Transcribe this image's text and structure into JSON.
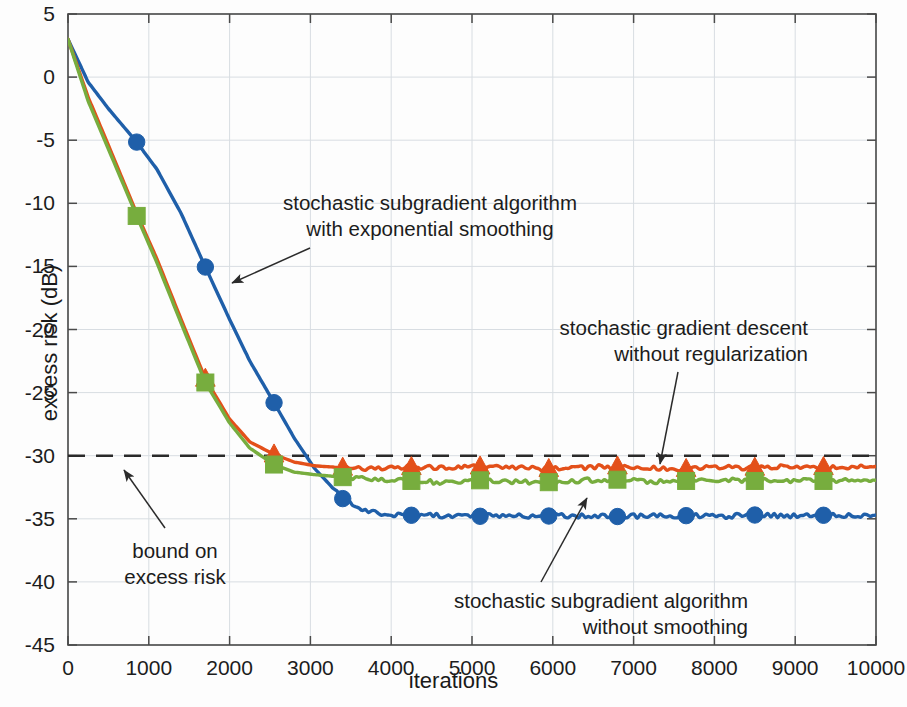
{
  "chart_data": {
    "type": "line",
    "title": "",
    "xlabel": "iterations",
    "ylabel": "excess risk (dB)",
    "xlim": [
      0,
      10000
    ],
    "ylim": [
      -45,
      5
    ],
    "xticks": [
      0,
      1000,
      2000,
      3000,
      4000,
      5000,
      6000,
      7000,
      8000,
      9000,
      10000
    ],
    "xtick_labels": [
      "0",
      "1000",
      "2000",
      "3000",
      "4000",
      "5000",
      "6000",
      "7000",
      "8000",
      "9000",
      "10000"
    ],
    "yticks": [
      5,
      0,
      -5,
      -10,
      -15,
      -20,
      -25,
      -30,
      -35,
      -40,
      -45
    ],
    "ytick_labels": [
      "5",
      "0",
      "-5",
      "-10",
      "-15",
      "-20",
      "-25",
      "-30",
      "-35",
      "-40",
      "-45"
    ],
    "grid": true,
    "legend_position": "none",
    "series": [
      {
        "name": "stochastic subgradient algorithm with exponential smoothing",
        "color": "#1f5fa9",
        "marker": "circle",
        "marker_every": 850,
        "x": [
          0,
          250,
          500,
          850,
          1100,
          1400,
          1700,
          2000,
          2250,
          2550,
          2800,
          3050,
          3400,
          3600,
          3800,
          4000,
          4250,
          4600,
          5100,
          5500,
          5950,
          6400,
          6800,
          7250,
          7650,
          8100,
          8500,
          8900,
          9350,
          9700,
          10000
        ],
        "y": [
          3.0,
          -0.4,
          -2.5,
          -5.15,
          -7.3,
          -10.8,
          -15.05,
          -19.2,
          -22.5,
          -25.8,
          -28.6,
          -31.0,
          -33.4,
          -34.2,
          -34.5,
          -34.65,
          -34.72,
          -34.75,
          -34.8,
          -34.75,
          -34.78,
          -34.75,
          -34.82,
          -34.78,
          -34.75,
          -34.8,
          -34.7,
          -34.75,
          -34.72,
          -34.7,
          -34.7
        ],
        "markers_x": [
          850,
          1700,
          2550,
          3400,
          4250,
          5100,
          5950,
          6800,
          7650,
          8500,
          9350
        ],
        "markers_y": [
          -5.15,
          -15.05,
          -25.8,
          -33.4,
          -34.72,
          -34.8,
          -34.78,
          -34.82,
          -34.75,
          -34.7,
          -34.72
        ]
      },
      {
        "name": "stochastic gradient descent without regularization",
        "color": "#e3501a",
        "marker": "triangle",
        "marker_every": 850,
        "x": [
          0,
          250,
          500,
          850,
          1100,
          1400,
          1700,
          2000,
          2250,
          2550,
          2800,
          3050,
          3400,
          3800,
          4250,
          4600,
          5100,
          5500,
          5950,
          6400,
          6800,
          7250,
          7650,
          8100,
          8500,
          8900,
          9350,
          9700,
          10000
        ],
        "y": [
          3.0,
          -1.6,
          -5.4,
          -10.8,
          -14.4,
          -19.2,
          -23.9,
          -27.1,
          -28.9,
          -29.9,
          -30.5,
          -30.8,
          -30.95,
          -31.0,
          -30.9,
          -30.95,
          -30.85,
          -30.95,
          -31.05,
          -30.95,
          -30.85,
          -31.0,
          -31.05,
          -30.9,
          -30.95,
          -30.85,
          -30.9,
          -30.85,
          -30.85
        ],
        "markers_x": [
          1700,
          2550,
          3400,
          4250,
          5100,
          5950,
          6800,
          7650,
          8500,
          9350
        ],
        "markers_y": [
          -23.9,
          -29.9,
          -30.95,
          -30.9,
          -30.85,
          -31.05,
          -30.85,
          -31.05,
          -30.95,
          -30.9
        ]
      },
      {
        "name": "stochastic subgradient algorithm without smoothing",
        "color": "#77ad3e",
        "marker": "square",
        "marker_every": 850,
        "x": [
          0,
          250,
          500,
          850,
          1100,
          1400,
          1700,
          2000,
          2250,
          2550,
          2800,
          3050,
          3400,
          3800,
          4250,
          4600,
          5100,
          5500,
          5950,
          6400,
          6800,
          7250,
          7650,
          8100,
          8500,
          8900,
          9350,
          9700,
          10000
        ],
        "y": [
          3.0,
          -1.9,
          -5.7,
          -11.0,
          -14.7,
          -19.5,
          -24.2,
          -27.4,
          -29.4,
          -30.7,
          -31.3,
          -31.5,
          -31.7,
          -31.9,
          -32.0,
          -32.1,
          -31.95,
          -32.05,
          -32.1,
          -31.95,
          -31.9,
          -32.05,
          -32.0,
          -31.9,
          -32.0,
          -31.95,
          -32.0,
          -31.95,
          -31.95
        ],
        "markers_x": [
          850,
          1700,
          2550,
          3400,
          4250,
          5100,
          5950,
          6800,
          7650,
          8500,
          9350
        ],
        "markers_y": [
          -11.0,
          -24.2,
          -30.7,
          -31.7,
          -32.0,
          -31.95,
          -32.1,
          -31.9,
          -32.0,
          -32.0,
          -32.0
        ]
      }
    ],
    "reference_lines": [
      {
        "name": "bound on excess risk",
        "orientation": "horizontal",
        "value": -30,
        "style": "dashed",
        "color": "#2a2a2a"
      }
    ],
    "annotations": [
      {
        "id": "annot-sgd-smoothing",
        "lines": [
          "stochastic subgradient algorithm",
          "with exponential smoothing"
        ],
        "align": "center",
        "text_x": 430,
        "text_y": 190,
        "arrow_from": [
          310,
          248
        ],
        "arrow_to": [
          232,
          283
        ]
      },
      {
        "id": "annot-sgd-noreg",
        "lines": [
          "stochastic gradient descent",
          "without regularization"
        ],
        "align": "right",
        "text_x": 808,
        "text_y": 315,
        "arrow_from": [
          678,
          372
        ],
        "arrow_to": [
          660,
          464
        ]
      },
      {
        "id": "annot-bound",
        "lines": [
          "bound on",
          "excess risk"
        ],
        "align": "center",
        "text_x": 175,
        "text_y": 538,
        "arrow_from": [
          165,
          528
        ],
        "arrow_to": [
          124,
          470
        ]
      },
      {
        "id": "annot-sgd-nosmoothing",
        "lines": [
          "stochastic subgradient algorithm",
          "without smoothing"
        ],
        "align": "right",
        "text_x": 748,
        "text_y": 588,
        "arrow_from": [
          541,
          582
        ],
        "arrow_to": [
          587,
          498
        ]
      }
    ],
    "axes_box": {
      "left": 68,
      "top": 14,
      "right": 876,
      "bottom": 645
    },
    "colors": {
      "blue": "#1f5fa9",
      "orange": "#e3501a",
      "green": "#77ad3e",
      "axis": "#4a4a4a",
      "grid": "#d8dde2",
      "bound": "#2a2a2a"
    }
  }
}
